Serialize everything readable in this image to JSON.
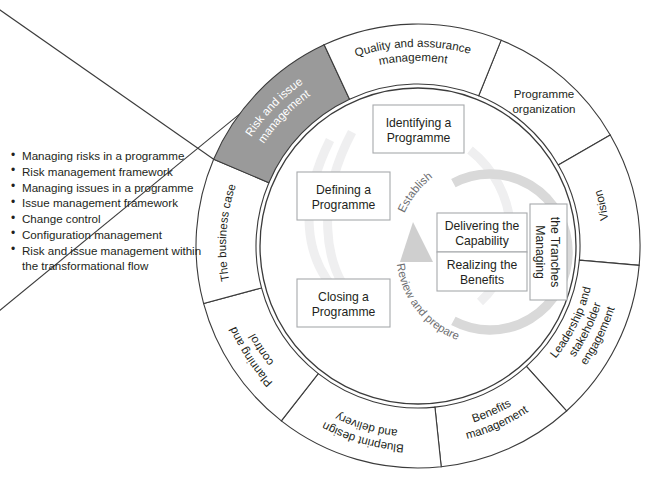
{
  "diagram": {
    "geometry": {
      "center_x": 418,
      "center_y": 246,
      "outer_radius": 222,
      "ring_inner_radius": 162,
      "inner_circle_radius": 158
    },
    "colors": {
      "highlight_fill": "#9a9a9a",
      "segment_fill": "#ffffff",
      "stroke": "#3b3b3b",
      "box_stroke": "#a7a9ac",
      "loop": "#d9d9d9",
      "phase_text": "#6d6e71",
      "highlight_text": "#ffffff"
    },
    "outer_ring": {
      "name": "governance-themes-ring",
      "segments": [
        {
          "id": "programme-organization",
          "label": "Programme organization",
          "lines": [
            "Programme",
            "organization"
          ],
          "start_deg": -68,
          "end_deg": -30,
          "orientation": "horizontal",
          "highlighted": false
        },
        {
          "id": "vision",
          "label": "Vision",
          "lines": [
            "Vision"
          ],
          "start_deg": -30,
          "end_deg": 5,
          "orientation": "tangential",
          "highlighted": false
        },
        {
          "id": "leadership-and-stakeholder-engagement",
          "label": "Leadership and stakeholder engagement",
          "lines": [
            "Leadership and",
            "stakeholder",
            "engagement"
          ],
          "start_deg": 5,
          "end_deg": 48,
          "orientation": "tangential",
          "highlighted": false
        },
        {
          "id": "benefits-management",
          "label": "Benefits management",
          "lines": [
            "Benefits",
            "management"
          ],
          "start_deg": 48,
          "end_deg": 84,
          "orientation": "tangential",
          "highlighted": false
        },
        {
          "id": "blueprint-design-and-delivery",
          "label": "Blueprint design and delivery",
          "lines": [
            "Blueprint design",
            "and delivery"
          ],
          "start_deg": 84,
          "end_deg": 128,
          "orientation": "tangential",
          "highlighted": false
        },
        {
          "id": "planning-and-control",
          "label": "Planning and control",
          "lines": [
            "Planning and",
            "control"
          ],
          "start_deg": 128,
          "end_deg": 165,
          "orientation": "tangential",
          "highlighted": false
        },
        {
          "id": "the-business-case",
          "label": "The business case",
          "lines": [
            "The business case"
          ],
          "start_deg": 165,
          "end_deg": 203,
          "orientation": "tangential",
          "highlighted": false
        },
        {
          "id": "risk-and-issue-management",
          "label": "Risk and issue management",
          "lines": [
            "Risk and issue",
            "management"
          ],
          "start_deg": 203,
          "end_deg": 245,
          "orientation": "tangential",
          "highlighted": true
        },
        {
          "id": "quality-and-assurance-management",
          "label": "Quality and assurance management",
          "lines": [
            "Quality and assurance",
            "management"
          ],
          "start_deg": 245,
          "end_deg": -68,
          "orientation": "tangential",
          "highlighted": false
        }
      ]
    },
    "process_boxes": [
      {
        "id": "identifying-a-programme",
        "label": "Identifying a Programme",
        "lines": [
          "Identifying a",
          "Programme"
        ],
        "x": 373,
        "y": 105,
        "w": 91,
        "h": 48
      },
      {
        "id": "defining-a-programme",
        "label": "Defining a Programme",
        "lines": [
          "Defining a",
          "Programme"
        ],
        "x": 297,
        "y": 172,
        "w": 93,
        "h": 48
      },
      {
        "id": "closing-a-programme",
        "label": "Closing a Programme",
        "lines": [
          "Closing a",
          "Programme"
        ],
        "x": 297,
        "y": 279,
        "w": 93,
        "h": 48
      },
      {
        "id": "delivering-the-capability",
        "label": "Delivering the Capability",
        "lines": [
          "Delivering the",
          "Capability"
        ],
        "x": 437,
        "y": 213,
        "w": 90,
        "h": 39
      },
      {
        "id": "realizing-the-benefits",
        "label": "Realizing the Benefits",
        "lines": [
          "Realizing the",
          "Benefits"
        ],
        "x": 437,
        "y": 252,
        "w": 90,
        "h": 39
      }
    ],
    "tranche_box": {
      "id": "managing-the-tranches",
      "label": "Managing the Tranches",
      "lines": [
        "Managing",
        "the Tranches"
      ],
      "x": 530,
      "y": 204,
      "w": 37,
      "h": 96,
      "orientation": "vertical"
    },
    "phase_labels": [
      {
        "id": "establish",
        "label": "Establish"
      },
      {
        "id": "review-and-prepare",
        "label": "Review and prepare"
      }
    ],
    "callout": {
      "name": "risk-and-issue-management-callout",
      "target_segment": "risk-and-issue-management",
      "items": [
        "Managing risks in a programme",
        "Risk management framework",
        "Managing issues in a programme",
        "Issue management framework",
        "Change control",
        "Configuration management",
        "Risk and issue management within the transformational flow"
      ]
    },
    "caption": ""
  }
}
